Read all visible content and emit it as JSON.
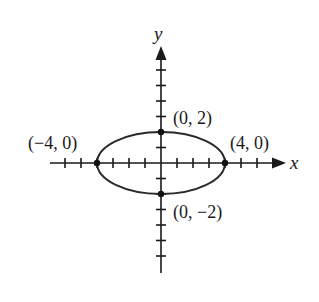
{
  "diagram": {
    "type": "ellipse-graph",
    "axes": {
      "x_label": "x",
      "y_label": "y",
      "origin_px": [
        161,
        163
      ],
      "unit_px": {
        "x": 16,
        "y": 15.5
      },
      "x_ticks": [
        -6,
        -5,
        -4,
        -3,
        -2,
        -1,
        1,
        2,
        3,
        4,
        5,
        6
      ],
      "y_ticks": [
        6,
        5,
        4,
        3,
        2,
        1,
        -1,
        -2,
        -3,
        -4,
        -5,
        -6
      ]
    },
    "ellipse": {
      "center": [
        0,
        0
      ],
      "semi_major_x": 4,
      "semi_minor_y": 2,
      "stroke_color": "#2a2a2a"
    },
    "points": [
      {
        "label": "(0, 2)",
        "x": 0,
        "y": 2
      },
      {
        "label": "(−4, 0)",
        "x": -4,
        "y": 0
      },
      {
        "label": "(4, 0)",
        "x": 4,
        "y": 0
      },
      {
        "label": "(0, −2)",
        "x": 0,
        "y": -2
      }
    ]
  }
}
